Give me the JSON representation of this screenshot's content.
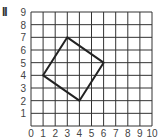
{
  "figure_label": "II",
  "grid": {
    "x_min": 0,
    "x_max": 10,
    "y_min": 0,
    "y_max": 9,
    "x_ticks": [
      "0",
      "1",
      "2",
      "3",
      "4",
      "5",
      "6",
      "7",
      "8",
      "9",
      "10"
    ],
    "y_ticks": [
      "1",
      "2",
      "3",
      "4",
      "5",
      "6",
      "7",
      "8",
      "9"
    ],
    "line_color": "#333333"
  },
  "shape": {
    "type": "square",
    "vertices": [
      [
        1,
        4
      ],
      [
        3,
        7
      ],
      [
        6,
        5
      ],
      [
        4,
        2
      ]
    ],
    "stroke_color": "#222222"
  }
}
